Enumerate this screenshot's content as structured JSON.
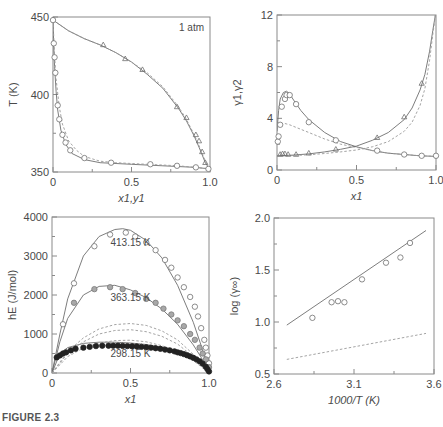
{
  "figure_caption": "FIGURE 2.3",
  "chart_data": [
    {
      "id": "panel-a",
      "type": "line",
      "title": "",
      "annotation": "1 atm",
      "xlabel": "x1,y1",
      "ylabel": "T (K)",
      "xlim": [
        0,
        1.0
      ],
      "ylim": [
        350,
        450
      ],
      "xticks": [
        "0",
        "0.5",
        "1.0"
      ],
      "yticks": [
        "350",
        "400",
        "450"
      ],
      "grid": false,
      "series": [
        {
          "name": "liquid x1 (data)",
          "marker": "open-circle",
          "x": [
            0,
            0.005,
            0.01,
            0.015,
            0.03,
            0.04,
            0.06,
            0.08,
            0.11,
            0.2,
            0.37,
            0.62,
            0.79,
            0.91,
            0.99
          ],
          "y": [
            448,
            433,
            424,
            414,
            393,
            384,
            374,
            369,
            364,
            359,
            356,
            355,
            354,
            353,
            352
          ]
        },
        {
          "name": "vapor y1 (data)",
          "marker": "open-triangle",
          "x": [
            0.32,
            0.46,
            0.57,
            0.79,
            0.85,
            0.91,
            0.93,
            0.95,
            0.97
          ],
          "y": [
            432,
            423,
            416,
            392,
            385,
            374,
            370,
            363,
            356
          ]
        },
        {
          "name": "bubble curve (model)",
          "style": "solid",
          "x": [
            0,
            0.005,
            0.01,
            0.02,
            0.03,
            0.05,
            0.08,
            0.12,
            0.2,
            0.3,
            0.5,
            0.7,
            0.9,
            1.0
          ],
          "y": [
            448,
            430,
            418,
            402,
            390,
            377,
            368,
            362,
            358,
            356,
            355,
            354,
            353,
            352
          ]
        },
        {
          "name": "bubble curve (alt model)",
          "style": "dashed",
          "x": [
            0,
            0.01,
            0.02,
            0.04,
            0.06,
            0.1,
            0.15,
            0.2,
            0.3,
            0.4,
            0.6,
            0.8,
            1.0
          ],
          "y": [
            448,
            425,
            410,
            392,
            381,
            370,
            364,
            360,
            357,
            356,
            355,
            354,
            352
          ]
        },
        {
          "name": "dew curve (model)",
          "style": "solid",
          "x": [
            0,
            0.1,
            0.2,
            0.3,
            0.4,
            0.5,
            0.6,
            0.7,
            0.8,
            0.85,
            0.9,
            0.93,
            0.95,
            0.97,
            0.99,
            1.0
          ],
          "y": [
            448,
            441,
            436,
            432,
            427,
            421,
            413,
            404,
            391,
            383,
            373,
            366,
            361,
            356,
            353,
            352
          ]
        },
        {
          "name": "dew curve (alt model)",
          "style": "dashed",
          "x": [
            0,
            0.1,
            0.2,
            0.3,
            0.4,
            0.5,
            0.6,
            0.7,
            0.8,
            0.85,
            0.9,
            0.93,
            0.95,
            0.97,
            0.99,
            1.0
          ],
          "y": [
            448,
            441,
            436,
            432,
            427,
            421,
            414,
            405,
            392,
            384,
            374,
            367,
            362,
            357,
            353,
            352
          ]
        }
      ]
    },
    {
      "id": "panel-b",
      "type": "line",
      "title": "",
      "xlabel": "x1",
      "ylabel": "γ1,γ2",
      "xlim": [
        0,
        1.0
      ],
      "ylim": [
        0,
        12
      ],
      "xticks": [
        "0",
        "0.5",
        "1.0"
      ],
      "yticks": [
        "0",
        "4",
        "8",
        "12"
      ],
      "grid": false,
      "series": [
        {
          "name": "γ1 (data)",
          "marker": "open-circle",
          "x": [
            0.005,
            0.01,
            0.02,
            0.03,
            0.05,
            0.06,
            0.08,
            0.12,
            0.2,
            0.37,
            0.63,
            0.8,
            0.91,
            1.0
          ],
          "y": [
            2.2,
            2.6,
            3.5,
            4.9,
            5.5,
            5.8,
            5.8,
            5.1,
            3.7,
            2.3,
            1.5,
            1.2,
            1.1,
            1.1
          ]
        },
        {
          "name": "γ2 (data)",
          "marker": "open-triangle",
          "x": [
            0.02,
            0.035,
            0.05,
            0.07,
            0.12,
            0.2,
            0.37,
            0.63,
            0.8,
            0.91
          ],
          "y": [
            1.2,
            1.25,
            1.25,
            1.2,
            1.2,
            1.3,
            1.6,
            2.5,
            4.1,
            6.7
          ]
        },
        {
          "name": "γ1 (model)",
          "style": "solid",
          "x": [
            0,
            0.01,
            0.02,
            0.04,
            0.06,
            0.08,
            0.1,
            0.15,
            0.2,
            0.3,
            0.4,
            0.5,
            0.6,
            0.7,
            0.8,
            0.9,
            1.0
          ],
          "y": [
            3.0,
            4.6,
            5.5,
            6.0,
            6.1,
            5.9,
            5.5,
            4.6,
            3.9,
            2.9,
            2.2,
            1.8,
            1.5,
            1.3,
            1.2,
            1.1,
            1.05
          ]
        },
        {
          "name": "γ1 (alt model)",
          "style": "dashed",
          "x": [
            0,
            0.02,
            0.05,
            0.08,
            0.12,
            0.2,
            0.3,
            0.4,
            0.5,
            0.6,
            0.7,
            0.8,
            0.9,
            1.0
          ],
          "y": [
            3.3,
            3.5,
            3.6,
            3.5,
            3.3,
            2.9,
            2.4,
            2.0,
            1.75,
            1.5,
            1.3,
            1.2,
            1.1,
            1.05
          ]
        },
        {
          "name": "γ2 (model)",
          "style": "solid",
          "x": [
            0,
            0.1,
            0.2,
            0.3,
            0.4,
            0.5,
            0.6,
            0.7,
            0.8,
            0.85,
            0.9,
            0.93,
            0.96,
            0.98,
            1.0
          ],
          "y": [
            1.1,
            1.15,
            1.25,
            1.4,
            1.6,
            1.85,
            2.3,
            2.9,
            3.9,
            4.8,
            6.2,
            7.4,
            9.2,
            10.8,
            12.3
          ]
        },
        {
          "name": "γ2 (alt model)",
          "style": "dashed",
          "x": [
            0,
            0.1,
            0.2,
            0.3,
            0.4,
            0.5,
            0.6,
            0.7,
            0.8,
            0.85,
            0.9,
            0.93,
            0.96,
            0.98,
            1.0
          ],
          "y": [
            1.1,
            1.12,
            1.18,
            1.28,
            1.4,
            1.55,
            1.8,
            2.2,
            3.0,
            3.7,
            5.0,
            6.3,
            8.5,
            10.5,
            12.3
          ]
        }
      ]
    },
    {
      "id": "panel-c",
      "type": "line",
      "title": "",
      "xlabel": "x1",
      "ylabel": "hE (J/mol)",
      "xlim": [
        0,
        1.0
      ],
      "ylim": [
        0,
        4000
      ],
      "xticks": [
        "0",
        "0.5",
        "1.0"
      ],
      "yticks": [
        "0",
        "1000",
        "2000",
        "3000",
        "4000"
      ],
      "grid": false,
      "annotations": [
        {
          "text": "413.15 K",
          "x": 0.5,
          "y": 3250
        },
        {
          "text": "363.15 K",
          "x": 0.5,
          "y": 1850
        },
        {
          "text": "298.15 K",
          "x": 0.5,
          "y": 400
        }
      ],
      "series": [
        {
          "name": "413.15 K (data)",
          "marker": "open-circle",
          "x": [
            0.07,
            0.14,
            0.27,
            0.37,
            0.47,
            0.53,
            0.6,
            0.66,
            0.72,
            0.76,
            0.8,
            0.84,
            0.88,
            0.91,
            0.93,
            0.95,
            0.97,
            0.98,
            0.99,
            1.0
          ],
          "y": [
            1250,
            2300,
            3250,
            3550,
            3600,
            3500,
            3350,
            3150,
            2900,
            2700,
            2450,
            2200,
            1950,
            1700,
            1450,
            1150,
            850,
            650,
            450,
            250
          ]
        },
        {
          "name": "363.15 K (data)",
          "marker": "gray-circle",
          "x": [
            0.14,
            0.27,
            0.37,
            0.45,
            0.53,
            0.6,
            0.66,
            0.71,
            0.76,
            0.8,
            0.84,
            0.88,
            0.91,
            0.94,
            0.96,
            0.98,
            1.0
          ],
          "y": [
            1800,
            2150,
            2200,
            2150,
            2050,
            1900,
            1800,
            1650,
            1500,
            1350,
            1200,
            1000,
            850,
            650,
            500,
            350,
            150
          ]
        },
        {
          "name": "298.15 K (data)",
          "marker": "filled-circle",
          "x": [
            0.03,
            0.05,
            0.07,
            0.09,
            0.12,
            0.15,
            0.2,
            0.24,
            0.28,
            0.32,
            0.36,
            0.39,
            0.42,
            0.45,
            0.48,
            0.51,
            0.54,
            0.57,
            0.6,
            0.63,
            0.66,
            0.69,
            0.72,
            0.75,
            0.78,
            0.8,
            0.82,
            0.84,
            0.86,
            0.88,
            0.9,
            0.92,
            0.94,
            0.96,
            0.98,
            0.99,
            1.0
          ],
          "y": [
            400,
            450,
            500,
            530,
            580,
            620,
            650,
            670,
            690,
            700,
            700,
            700,
            700,
            695,
            690,
            685,
            680,
            670,
            660,
            650,
            635,
            620,
            600,
            580,
            555,
            530,
            510,
            485,
            455,
            425,
            390,
            350,
            300,
            240,
            160,
            100,
            40
          ]
        },
        {
          "name": "413.15 K (model)",
          "style": "solid",
          "x": [
            0,
            0.05,
            0.1,
            0.2,
            0.3,
            0.4,
            0.45,
            0.5,
            0.6,
            0.7,
            0.8,
            0.9,
            0.95,
            1.0
          ],
          "y": [
            0,
            1000,
            1900,
            3000,
            3500,
            3680,
            3700,
            3660,
            3400,
            2950,
            2250,
            1300,
            700,
            0
          ]
        },
        {
          "name": "363.15 K (model)",
          "style": "solid",
          "x": [
            0,
            0.05,
            0.1,
            0.2,
            0.3,
            0.4,
            0.5,
            0.6,
            0.7,
            0.8,
            0.9,
            0.95,
            1.0
          ],
          "y": [
            0,
            800,
            1400,
            2000,
            2220,
            2250,
            2130,
            1930,
            1640,
            1250,
            720,
            400,
            0
          ]
        },
        {
          "name": "298.15 K (model)",
          "style": "solid",
          "x": [
            0,
            0.05,
            0.1,
            0.2,
            0.3,
            0.4,
            0.5,
            0.6,
            0.7,
            0.8,
            0.9,
            0.95,
            1.0
          ],
          "y": [
            0,
            500,
            650,
            760,
            790,
            790,
            770,
            730,
            660,
            550,
            370,
            220,
            0
          ]
        },
        {
          "name": "alt model 1",
          "style": "dashed",
          "x": [
            0,
            0.1,
            0.2,
            0.3,
            0.4,
            0.5,
            0.6,
            0.7,
            0.8,
            0.9,
            1.0
          ],
          "y": [
            0,
            550,
            900,
            1130,
            1240,
            1270,
            1220,
            1080,
            850,
            480,
            0
          ]
        },
        {
          "name": "alt model 2",
          "style": "dashed",
          "x": [
            0,
            0.1,
            0.2,
            0.3,
            0.4,
            0.5,
            0.6,
            0.7,
            0.8,
            0.9,
            1.0
          ],
          "y": [
            0,
            500,
            800,
            1000,
            1090,
            1110,
            1060,
            940,
            740,
            420,
            0
          ]
        },
        {
          "name": "alt model 3",
          "style": "dashed",
          "x": [
            0,
            0.1,
            0.2,
            0.3,
            0.4,
            0.5,
            0.6,
            0.7,
            0.8,
            0.9,
            1.0
          ],
          "y": [
            0,
            420,
            640,
            770,
            830,
            840,
            800,
            700,
            550,
            320,
            0
          ]
        }
      ]
    },
    {
      "id": "panel-d",
      "type": "scatter",
      "title": "",
      "xlabel": "1000/T (K)",
      "ylabel": "log (γ∞)",
      "xlim": [
        2.6,
        3.6
      ],
      "ylim": [
        0.5,
        2.0
      ],
      "xticks": [
        "2.6",
        "3.1",
        "3.6"
      ],
      "yticks": [
        "0.5",
        "1.0",
        "1.5",
        "2.0"
      ],
      "grid": false,
      "series": [
        {
          "name": "data",
          "marker": "open-circle",
          "x": [
            2.84,
            2.96,
            3.0,
            3.04,
            3.15,
            3.3,
            3.39,
            3.45
          ],
          "y": [
            1.04,
            1.19,
            1.2,
            1.19,
            1.41,
            1.57,
            1.62,
            1.76
          ]
        },
        {
          "name": "fit",
          "style": "solid",
          "x": [
            2.68,
            3.55
          ],
          "y": [
            0.97,
            1.88
          ]
        },
        {
          "name": "alt model",
          "style": "dashed",
          "x": [
            2.68,
            3.55
          ],
          "y": [
            0.64,
            0.89
          ]
        }
      ]
    }
  ],
  "panels_layout": [
    {
      "x0": 53,
      "x1": 210,
      "yTop": 17,
      "yBot": 172
    },
    {
      "x0": 277,
      "x1": 436,
      "yTop": 15,
      "yBot": 170
    },
    {
      "x0": 52,
      "x1": 209,
      "yTop": 217,
      "yBot": 373
    },
    {
      "x0": 274,
      "x1": 434,
      "yTop": 218,
      "yBot": 374
    }
  ],
  "colors": {
    "axis": "#8a8a8a",
    "line": "#6e6e6e",
    "dash": "#9a9a9a",
    "marker": "#707070",
    "gray_fill": "#a8a8a8",
    "black_fill": "#222222",
    "text": "#4a4a4a"
  }
}
